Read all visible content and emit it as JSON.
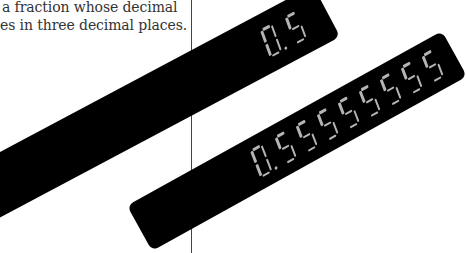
{
  "caption": {
    "line1": "a fraction whose decimal",
    "line2": "es in three decimal places."
  },
  "displays": [
    {
      "name": "calculator-display-short",
      "value": "0.5",
      "digits": [
        {
          "char": "0",
          "dp": true
        },
        {
          "char": "5",
          "dp": false
        }
      ]
    },
    {
      "name": "calculator-display-long",
      "value": "0.55555555",
      "digits": [
        {
          "char": "0",
          "dp": true
        },
        {
          "char": "5",
          "dp": false
        },
        {
          "char": "5",
          "dp": false
        },
        {
          "char": "5",
          "dp": false
        },
        {
          "char": "5",
          "dp": false
        },
        {
          "char": "5",
          "dp": false
        },
        {
          "char": "5",
          "dp": false
        },
        {
          "char": "5",
          "dp": false
        },
        {
          "char": "5",
          "dp": false
        }
      ]
    }
  ],
  "colors": {
    "display_background": "#000000",
    "segment": "#b4b4b4",
    "text": "#333333",
    "divider": "#444444"
  }
}
